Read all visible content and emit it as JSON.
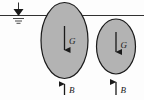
{
  "figure": {
    "background_color": "#fdfdfd",
    "line_color": "#1a1a1a",
    "body_fill_color": "#b3b3b3"
  },
  "water_surface": {
    "name": "water-surface-line",
    "symbol_label": "water-level-symbol",
    "y": 15.5,
    "x_start": 0,
    "x_end": 144
  },
  "bodies": [
    {
      "id": "left-body",
      "cx": 64.5,
      "cy": 40.5,
      "rx": 23.5,
      "ry": 38.0,
      "gravity": {
        "label": "G",
        "direction": "down",
        "x": 64.5,
        "y_start": 26.0,
        "y_end": 56.0,
        "label_x": 69.0,
        "label_y": 44.0
      },
      "buoyancy": {
        "label": "B",
        "direction": "up",
        "x": 64.5,
        "y_start": 95.0,
        "y_end": 78.0,
        "label_x": 69.0,
        "label_y": 92.0
      }
    },
    {
      "id": "right-body",
      "cx": 116.0,
      "cy": 46.5,
      "rx": 19.5,
      "ry": 27.5,
      "gravity": {
        "label": "G",
        "direction": "down",
        "x": 116.0,
        "y_start": 32.0,
        "y_end": 58.0,
        "label_x": 120.5,
        "label_y": 48.0
      },
      "buoyancy": {
        "label": "B",
        "direction": "up",
        "x": 116.0,
        "y_start": 95.0,
        "y_end": 76.0,
        "label_x": 120.5,
        "label_y": 92.0
      }
    }
  ],
  "legend": {
    "gravity_symbol": "G",
    "buoyancy_symbol": "B"
  }
}
